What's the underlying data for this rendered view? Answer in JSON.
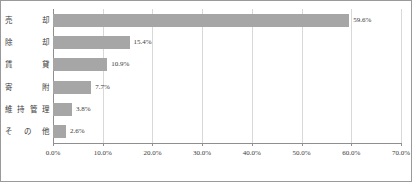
{
  "chart_data": {
    "type": "bar",
    "orientation": "horizontal",
    "title": "",
    "subtitle": "",
    "xlabel": "",
    "ylabel": "",
    "categories": [
      "売　却",
      "除　却",
      "賃　貸",
      "寄　附",
      "維持管理",
      "その他"
    ],
    "values": [
      59.6,
      15.4,
      10.9,
      7.7,
      3.8,
      2.6
    ],
    "data_labels": [
      "59.6%",
      "15.4%",
      "10.9%",
      "7.7%",
      "3.8%",
      "2.6%"
    ],
    "xlim": [
      0,
      70
    ],
    "xticks": [
      0,
      10,
      20,
      30,
      40,
      50,
      60,
      70
    ],
    "xtick_labels": [
      "0.0%",
      "10.0%",
      "20.0%",
      "30.0%",
      "40.0%",
      "50.0%",
      "60.0%",
      "70.0%"
    ],
    "grid": true,
    "grid_axis": "x",
    "legend": false,
    "legend_position": "none",
    "annotations": [],
    "colors": {
      "bar": "#a6a6a6",
      "gridline": "#d8d8d8",
      "axis": "#8f8f8f",
      "text": "#3a3a3a",
      "background": "#ffffff",
      "border": "#9a9a9a"
    }
  }
}
